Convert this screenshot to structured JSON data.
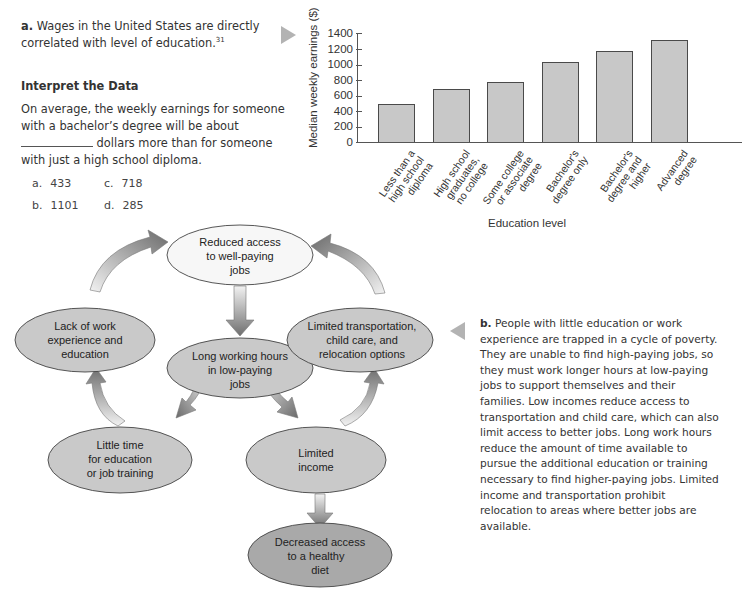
{
  "panel_a": {
    "label": "a.",
    "caption": " Wages in the United States are directly correlated with level of education.",
    "footnote": "31",
    "interpret_title": "Interpret the Data",
    "question_part1": "On average, the weekly earnings for someone with a bachelor’s degree will be about ",
    "question_part2": " dollars more than for someone with just a high school diploma.",
    "options": [
      {
        "letter": "a.",
        "value": "433"
      },
      {
        "letter": "c.",
        "value": "718"
      },
      {
        "letter": "b.",
        "value": "1101"
      },
      {
        "letter": "d.",
        "value": "285"
      }
    ]
  },
  "chart_data": {
    "type": "bar",
    "title": "",
    "xlabel": "Education level",
    "ylabel": "Median weekly earnings ($)",
    "ylim": [
      0,
      1400
    ],
    "yticks": [
      "1400",
      "1200",
      "1000",
      "800",
      "600",
      "400",
      "200",
      "0"
    ],
    "grid": false,
    "legend": "none",
    "categories": [
      "Less than a high school diploma",
      "High school graduates, no college",
      "Some college or associate degree",
      "Bachelor's degree only",
      "Bachelor's degree and higher",
      "Advanced degree"
    ],
    "category_lines": [
      [
        "Less than a",
        "high school",
        "diploma"
      ],
      [
        "High school",
        "graduates,",
        "no college"
      ],
      [
        "Some college",
        "or associate",
        "degree"
      ],
      [
        "Bachelor's",
        "degree only"
      ],
      [
        "Bachelor's",
        "degree and",
        "higher"
      ],
      [
        "Advanced",
        "degree"
      ]
    ],
    "values": [
      490,
      680,
      765,
      1025,
      1170,
      1315
    ],
    "bar_color": "#c8c8c8"
  },
  "diagram": {
    "nodes": [
      {
        "id": "reduced-access",
        "lines": [
          "Reduced access",
          "to well-paying",
          "jobs"
        ]
      },
      {
        "id": "lack-of-work",
        "lines": [
          "Lack of work",
          "experience and",
          "education"
        ]
      },
      {
        "id": "long-hours",
        "lines": [
          "Long working hours",
          "in low-paying",
          "jobs"
        ]
      },
      {
        "id": "limited-transport",
        "lines": [
          "Limited transportation,",
          "child care, and",
          "relocation options"
        ]
      },
      {
        "id": "little-time",
        "lines": [
          "Little time",
          "for education",
          "or job training"
        ]
      },
      {
        "id": "limited-income",
        "lines": [
          "Limited",
          "income"
        ]
      },
      {
        "id": "decreased-diet",
        "lines": [
          "Decreased access",
          "to a healthy",
          "diet"
        ]
      }
    ],
    "colors": {
      "node_light": "#f7f7f7",
      "node_gray": "#c9c9c9",
      "node_dark": "#a9a9a9",
      "arrow_dark": "#6e6e6e",
      "arrow_light": "#f2f2f2"
    }
  },
  "panel_b": {
    "label": "b.",
    "text": " People with little education or work experience are trapped in a cycle of poverty. They are unable to find high-paying jobs, so they must work longer hours at low-paying jobs to support themselves and their families. Low incomes reduce access to transportation and child care, which can also limit access to better jobs. Long work hours reduce the amount of time available to pursue the additional education or training necessary to find higher-paying jobs. Limited income and transportation prohibit relocation to areas where better jobs are available."
  }
}
